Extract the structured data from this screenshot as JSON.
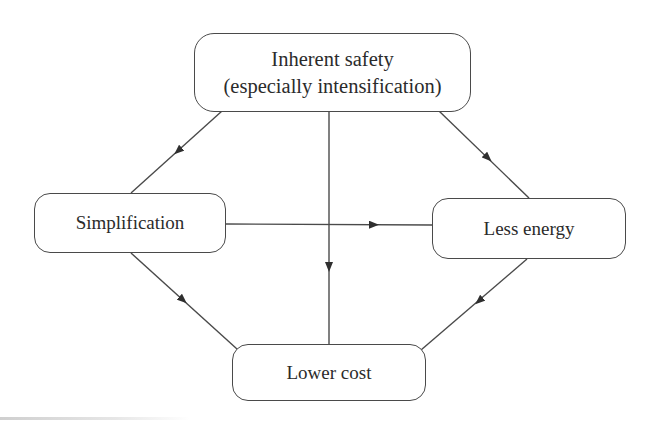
{
  "diagram": {
    "type": "flow",
    "nodes": [
      {
        "id": "inherent-safety",
        "lines": [
          "Inherent safety",
          "(especially intensification)"
        ]
      },
      {
        "id": "simplification",
        "lines": [
          "Simplification"
        ]
      },
      {
        "id": "less-energy",
        "lines": [
          "Less energy"
        ]
      },
      {
        "id": "lower-cost",
        "lines": [
          "Lower cost"
        ]
      }
    ],
    "edges": [
      {
        "from": "inherent-safety",
        "to": "simplification"
      },
      {
        "from": "inherent-safety",
        "to": "less-energy"
      },
      {
        "from": "inherent-safety",
        "to": "lower-cost"
      },
      {
        "from": "simplification",
        "to": "less-energy"
      },
      {
        "from": "simplification",
        "to": "lower-cost"
      },
      {
        "from": "less-energy",
        "to": "lower-cost"
      }
    ],
    "colors": {
      "line": "#4a4a4a",
      "box_border": "#4a4a4a",
      "text": "#2b2b2b",
      "background": "#ffffff"
    }
  }
}
